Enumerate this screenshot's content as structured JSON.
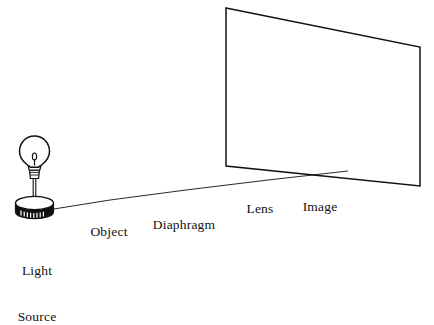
{
  "figure": {
    "type": "optics-ray-diagram",
    "background_color": "#ffffff",
    "ink_color": "#111111",
    "components": [
      {
        "id": "light-source",
        "label": "Light\nSource",
        "label_lines": [
          "Light",
          "Source"
        ],
        "element": "incandescent bulb on ribbed screw base with stem and cylindrical stand",
        "order": 1
      },
      {
        "id": "object",
        "label": "Object",
        "label_lines": [
          "Object"
        ],
        "element": "flat rectangular slide panel bearing an upright double-chevron arrow outline, mounted on post and cylindrical stand",
        "order": 2
      },
      {
        "id": "diaphragm",
        "label": "Diaphragm",
        "label_lines": [
          "Diaphragm"
        ],
        "element": "dark perforated mesh screen: wide rear mesh band plus framed front panel split into two mesh halves by a vertical bar, on post and cylindrical stand",
        "order": 3
      },
      {
        "id": "lens",
        "label": "Lens",
        "label_lines": [
          "Lens"
        ],
        "element": "convex lens drawn as a tilted ellipse with edge thickness, on post and cylindrical stand",
        "order": 4
      },
      {
        "id": "image",
        "label": "Image",
        "label_lines": [
          "Image"
        ],
        "element": "projection screen with an inverted double-chevron arrow rendered in sketchy diagonal hatching; stand with short post",
        "order": 5
      }
    ],
    "labels": {
      "light_source_line1": "Light",
      "light_source_line2": "Source",
      "object": "Object",
      "diaphragm": "Diaphragm",
      "lens": "Lens",
      "image": "Image"
    }
  }
}
